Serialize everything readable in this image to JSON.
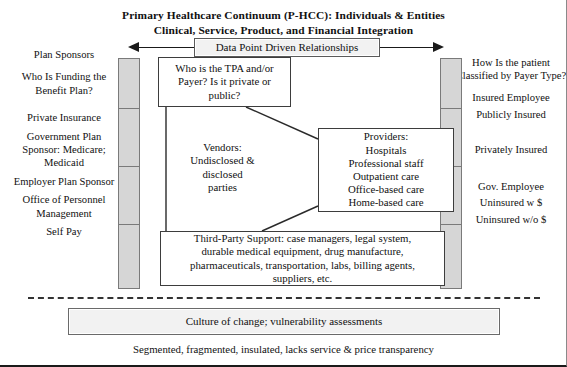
{
  "title": {
    "line1": "Primary Healthcare Continuum (P-HCC): Individuals & Entities",
    "line2": "Clinical, Service, Product, and Financial Integration"
  },
  "arrow_band": {
    "label": "Data Point Driven Relationships",
    "left_arrow_icon": "arrow-left-icon",
    "right_arrow_icon": "arrow-right-icon"
  },
  "left_column": {
    "entries": [
      "Plan Sponsors",
      "Who Is Funding the Benefit Plan?",
      "Private Insurance",
      "Government Plan Sponsor: Medicare; Medicaid",
      "Employer Plan Sponsor",
      "Office of Personnel Management",
      "Self Pay"
    ]
  },
  "right_column": {
    "entries": [
      "How Is the patient Classified by Payer Type?",
      "Insured Employee",
      "Publicly Insured",
      "Privately Insured",
      "Gov. Employee",
      "Uninsured w $",
      "Uninsured w/o $"
    ]
  },
  "bars": {
    "left_segments": 4,
    "right_segments": 4,
    "fill_color": "#d6d6d6",
    "border_color": "#7a7a7a"
  },
  "center": {
    "tpa_box": "Who is the TPA and/or Payer? Is it private or public?",
    "vendors_text": "Vendors: Undisclosed & disclosed parties",
    "providers_box": "Providers: Hospitals Professional staff Outpatient care Office-based care Home-based care",
    "providers_lines": [
      "Providers:",
      "Hospitals",
      "Professional staff",
      "Outpatient care",
      "Office-based care",
      "Home-based care"
    ],
    "tpa_lines": [
      "Who is the TPA and/or",
      "Payer? Is it private or",
      "public?"
    ],
    "vendors_lines": [
      "Vendors:",
      "Undisclosed &",
      "disclosed",
      "parties"
    ],
    "thirdparty_lines": [
      "Third-Party Support: case managers, legal system,",
      "durable medical equipment, drug manufacture,",
      "pharmaceuticals, transportation, labs, billing agents,",
      "suppliers, etc."
    ]
  },
  "culture_box": "Culture of change; vulnerability assessments",
  "footer_note": "Segmented, fragmented, insulated, lacks service & price transparency",
  "colors": {
    "box_fill": "#f2f2f2",
    "bar_fill": "#d6d6d6",
    "line": "#1a1a1a",
    "text": "#111111"
  }
}
